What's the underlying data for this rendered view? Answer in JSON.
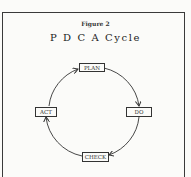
{
  "figure": {
    "label": "Figure 2",
    "title": "P D C A Cycle"
  },
  "cycle": {
    "stages": [
      {
        "id": "plan",
        "label": "PLAN"
      },
      {
        "id": "do",
        "label": "DO"
      },
      {
        "id": "check",
        "label": "CHECK"
      },
      {
        "id": "act",
        "label": "ACT"
      }
    ],
    "direction": "clockwise",
    "line_color": "#333333"
  }
}
